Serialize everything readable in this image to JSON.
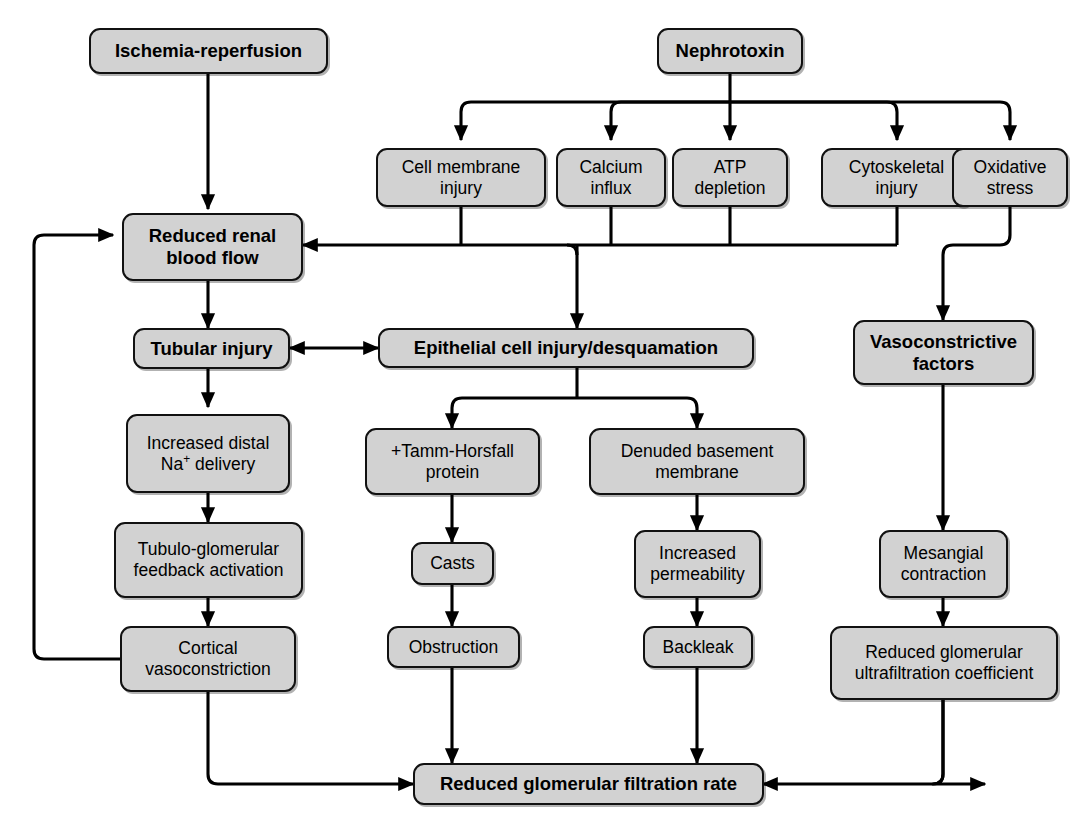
{
  "diagram": {
    "background_color": "#ffffff",
    "node_fill_color": "#d2d2d2",
    "node_border_color": "#111111",
    "edge_color": "#000000",
    "nodes": {
      "ischemia_reperfusion": "Ischemia-reperfusion",
      "nephrotoxin": "Nephrotoxin",
      "cell_membrane_injury_l1": "Cell membrane",
      "cell_membrane_injury_l2": "injury",
      "calcium_influx_l1": "Calcium",
      "calcium_influx_l2": "influx",
      "atp_depletion_l1": "ATP",
      "atp_depletion_l2": "depletion",
      "cytoskeletal_injury_l1": "Cytoskeletal",
      "cytoskeletal_injury_l2": "injury",
      "oxidative_stress_l1": "Oxidative",
      "oxidative_stress_l2": "stress",
      "reduced_renal_blood_flow_l1": "Reduced renal",
      "reduced_renal_blood_flow_l2": "blood flow",
      "tubular_injury": "Tubular injury",
      "epithelial_cell_injury": "Epithelial cell injury/desquamation",
      "vasoconstrictive_factors_l1": "Vasoconstrictive",
      "vasoconstrictive_factors_l2": "factors",
      "increased_distal_na_l1": "Increased distal",
      "increased_distal_na_l2_pre": "Na",
      "increased_distal_na_l2_sup": "+",
      "increased_distal_na_l2_post": " delivery",
      "tubulo_glomerular_l1": "Tubulo-glomerular",
      "tubulo_glomerular_l2": "feedback activation",
      "tamm_horsfall_l1": "+Tamm-Horsfall",
      "tamm_horsfall_l2": "protein",
      "denuded_basement_l1": "Denuded basement",
      "denuded_basement_l2": "membrane",
      "casts": "Casts",
      "increased_permeability_l1": "Increased",
      "increased_permeability_l2": "permeability",
      "mesangial_contraction_l1": "Mesangial",
      "mesangial_contraction_l2": "contraction",
      "cortical_vasoconstriction_l1": "Cortical",
      "cortical_vasoconstriction_l2": "vasoconstriction",
      "obstruction": "Obstruction",
      "backleak": "Backleak",
      "reduced_ultrafiltration_l1": "Reduced glomerular",
      "reduced_ultrafiltration_l2": "ultrafiltration coefficient",
      "reduced_gfr": "Reduced glomerular filtration rate"
    },
    "edges": [
      {
        "from": "ischemia_reperfusion",
        "to": "reduced_renal_blood_flow",
        "arrow": "single"
      },
      {
        "from": "nephrotoxin",
        "to": "cell_membrane_injury",
        "arrow": "single"
      },
      {
        "from": "nephrotoxin",
        "to": "calcium_influx",
        "arrow": "single"
      },
      {
        "from": "nephrotoxin",
        "to": "atp_depletion",
        "arrow": "single"
      },
      {
        "from": "nephrotoxin",
        "to": "cytoskeletal_injury",
        "arrow": "single"
      },
      {
        "from": "nephrotoxin",
        "to": "oxidative_stress",
        "arrow": "single"
      },
      {
        "from": "injury_bus",
        "to": "reduced_renal_blood_flow",
        "arrow": "single"
      },
      {
        "from": "injury_bus",
        "to": "epithelial_cell_injury",
        "arrow": "single"
      },
      {
        "from": "oxidative_stress",
        "to": "vasoconstrictive_factors",
        "arrow": "single"
      },
      {
        "from": "reduced_renal_blood_flow",
        "to": "tubular_injury",
        "arrow": "single"
      },
      {
        "from": "tubular_injury",
        "to": "epithelial_cell_injury",
        "arrow": "double"
      },
      {
        "from": "tubular_injury",
        "to": "increased_distal_na",
        "arrow": "single"
      },
      {
        "from": "increased_distal_na",
        "to": "tubulo_glomerular",
        "arrow": "single"
      },
      {
        "from": "tubulo_glomerular",
        "to": "cortical_vasoconstriction",
        "arrow": "single"
      },
      {
        "from": "cortical_vasoconstriction",
        "to": "reduced_renal_blood_flow",
        "arrow": "single"
      },
      {
        "from": "cortical_vasoconstriction",
        "to": "reduced_gfr",
        "arrow": "single"
      },
      {
        "from": "epithelial_cell_injury",
        "to": "tamm_horsfall",
        "arrow": "single"
      },
      {
        "from": "epithelial_cell_injury",
        "to": "denuded_basement",
        "arrow": "single"
      },
      {
        "from": "tamm_horsfall",
        "to": "casts",
        "arrow": "single"
      },
      {
        "from": "casts",
        "to": "obstruction",
        "arrow": "single"
      },
      {
        "from": "obstruction",
        "to": "reduced_gfr",
        "arrow": "single"
      },
      {
        "from": "denuded_basement",
        "to": "increased_permeability",
        "arrow": "single"
      },
      {
        "from": "increased_permeability",
        "to": "backleak",
        "arrow": "single"
      },
      {
        "from": "backleak",
        "to": "reduced_gfr",
        "arrow": "single"
      },
      {
        "from": "vasoconstrictive_factors",
        "to": "mesangial_contraction",
        "arrow": "single"
      },
      {
        "from": "mesangial_contraction",
        "to": "reduced_ultrafiltration",
        "arrow": "single"
      },
      {
        "from": "reduced_ultrafiltration",
        "to": "reduced_gfr",
        "arrow": "single"
      }
    ]
  }
}
